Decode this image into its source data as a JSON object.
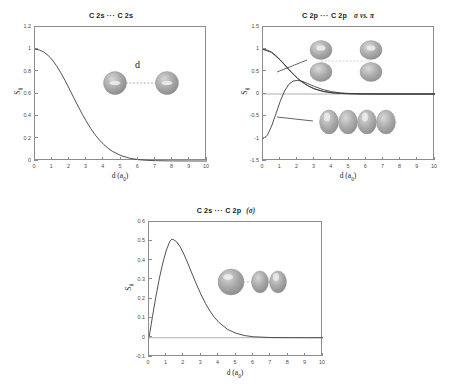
{
  "figure": {
    "background": "#ffffff",
    "axis_color": "#8c8c8c",
    "curve_color": "#3d3d3d",
    "tick_color": "#4d4d4d"
  },
  "panels": [
    {
      "id": "panel-2s-2s",
      "title_parts": {
        "left": "C 2s",
        "dots": "···",
        "right": "C 2s",
        "suffix": ""
      },
      "xlabel_main": "d (a",
      "xlabel_sub": "0",
      "xlabel_end": ")",
      "ylabel_main": "S",
      "ylabel_sub": "ij",
      "ylabel_sup": "σ",
      "xticks": [
        "0",
        "1",
        "2",
        "3",
        "4",
        "5",
        "6",
        "7",
        "8",
        "9",
        "10"
      ],
      "yticks": [
        "1.2",
        "1",
        "0.8",
        "0.6",
        "0.4",
        "0.2",
        "0"
      ],
      "annotation_d": "d"
    },
    {
      "id": "panel-2p-2p",
      "title_parts": {
        "left": "C 2p",
        "dots": "···",
        "right": "C 2p",
        "suffix": "σ vs. π"
      },
      "xlabel_main": "d (a",
      "xlabel_sub": "0",
      "xlabel_end": ")",
      "ylabel_main": "S",
      "ylabel_sub": "ij",
      "ylabel_sup": "σ",
      "xticks": [
        "0",
        "1",
        "2",
        "3",
        "4",
        "5",
        "6",
        "7",
        "8",
        "9",
        "10"
      ],
      "yticks": [
        "1.5",
        "1",
        "0.5",
        "0",
        "-0.5",
        "-1",
        "-1.5"
      ],
      "annotation_d": ""
    },
    {
      "id": "panel-2s-2p",
      "title_parts": {
        "left": "C 2s",
        "dots": "···",
        "right": "C 2p",
        "suffix": "(σ)"
      },
      "xlabel_main": "d (a",
      "xlabel_sub": "0",
      "xlabel_end": ")",
      "ylabel_main": "S",
      "ylabel_sub": "ij",
      "ylabel_sup": "σ",
      "xticks": [
        "0",
        "1",
        "2",
        "3",
        "4",
        "5",
        "6",
        "7",
        "8",
        "9",
        "10"
      ],
      "yticks": [
        "0.6",
        "0.5",
        "0.4",
        "0.3",
        "0.2",
        "0.1",
        "0",
        "-0.1"
      ],
      "annotation_d": ""
    }
  ],
  "chart_data": [
    {
      "type": "line",
      "title": "C 2s ··· C 2s",
      "xlabel": "d (a0)",
      "ylabel": "Sij",
      "xlim": [
        0,
        10
      ],
      "ylim": [
        0,
        1.2
      ],
      "grid": false,
      "legend": "none",
      "series": [
        {
          "name": "S(2s,2s)",
          "x": [
            0,
            0.25,
            0.5,
            0.75,
            1.0,
            1.25,
            1.5,
            1.75,
            2.0,
            2.25,
            2.5,
            2.75,
            3.0,
            3.25,
            3.5,
            3.75,
            4.0,
            4.25,
            4.5,
            5.0,
            5.5,
            6.0,
            6.5,
            7.0,
            8.0,
            9.0,
            10.0
          ],
          "values": [
            1.0,
            0.995,
            0.977,
            0.948,
            0.906,
            0.853,
            0.79,
            0.72,
            0.645,
            0.568,
            0.492,
            0.419,
            0.351,
            0.289,
            0.234,
            0.187,
            0.147,
            0.114,
            0.087,
            0.048,
            0.025,
            0.012,
            0.006,
            0.003,
            0.0006,
            0.0001,
            0.0
          ]
        }
      ]
    },
    {
      "type": "line",
      "title": "C 2p ··· C 2p  σ vs. π",
      "xlabel": "d (a0)",
      "ylabel": "Sij",
      "xlim": [
        0,
        10
      ],
      "ylim": [
        -1.5,
        1.5
      ],
      "grid": false,
      "legend": "none",
      "series": [
        {
          "name": "π overlap",
          "x": [
            0,
            0.25,
            0.5,
            0.75,
            1.0,
            1.25,
            1.5,
            1.75,
            2.0,
            2.25,
            2.5,
            2.75,
            3.0,
            3.5,
            4.0,
            4.5,
            5.0,
            5.5,
            6.0,
            7.0,
            8.0,
            9.0,
            10.0
          ],
          "values": [
            1.0,
            0.983,
            0.935,
            0.86,
            0.766,
            0.661,
            0.554,
            0.451,
            0.358,
            0.277,
            0.21,
            0.155,
            0.113,
            0.056,
            0.026,
            0.012,
            0.005,
            0.002,
            0.001,
            0.0002,
            0.0,
            0.0,
            0.0
          ]
        },
        {
          "name": "σ overlap",
          "x": [
            0,
            0.25,
            0.5,
            0.75,
            1.0,
            1.25,
            1.5,
            1.75,
            2.0,
            2.25,
            2.5,
            2.75,
            3.0,
            3.5,
            4.0,
            4.5,
            5.0,
            5.5,
            6.0,
            7.0,
            8.0,
            9.0,
            10.0
          ],
          "values": [
            -1.0,
            -0.925,
            -0.72,
            -0.445,
            -0.165,
            0.065,
            0.215,
            0.29,
            0.305,
            0.288,
            0.252,
            0.21,
            0.168,
            0.097,
            0.051,
            0.025,
            0.012,
            0.005,
            0.002,
            0.0004,
            0.0,
            0.0,
            0.0
          ]
        },
        {
          "name": "σ overlap (alt branch)",
          "x": [
            0,
            0.5,
            1.0,
            1.5,
            2.0,
            2.5,
            3.0,
            3.5,
            4.0,
            4.5,
            5.0,
            6.0,
            7.0,
            8.0,
            10.0
          ],
          "values": [
            1.0,
            0.93,
            0.76,
            0.545,
            0.35,
            0.208,
            0.115,
            0.06,
            0.03,
            0.014,
            0.006,
            0.001,
            0.0,
            0.0,
            0.0
          ]
        }
      ]
    },
    {
      "type": "line",
      "title": "C 2s ··· C 2p (σ)",
      "xlabel": "d (a0)",
      "ylabel": "Sij",
      "xlim": [
        0,
        10
      ],
      "ylim": [
        -0.1,
        0.6
      ],
      "grid": false,
      "legend": "none",
      "series": [
        {
          "name": "S(2s,2pσ)",
          "x": [
            0,
            0.2,
            0.4,
            0.6,
            0.8,
            1.0,
            1.2,
            1.3,
            1.4,
            1.6,
            1.8,
            2.0,
            2.25,
            2.5,
            2.75,
            3.0,
            3.25,
            3.5,
            3.75,
            4.0,
            4.5,
            5.0,
            5.5,
            6.0,
            7.0,
            8.0,
            9.0,
            10.0
          ],
          "values": [
            0.0,
            0.11,
            0.215,
            0.31,
            0.39,
            0.455,
            0.5,
            0.51,
            0.509,
            0.496,
            0.47,
            0.434,
            0.382,
            0.326,
            0.272,
            0.222,
            0.177,
            0.139,
            0.107,
            0.081,
            0.044,
            0.023,
            0.011,
            0.005,
            0.001,
            0.0002,
            0.0,
            0.0
          ]
        }
      ]
    }
  ],
  "orbital_graphics": {
    "panel1_spheres": 2,
    "panel2_pi_lobes": 4,
    "panel2_sigma_lobes": 4,
    "panel3_lobes": 3
  }
}
